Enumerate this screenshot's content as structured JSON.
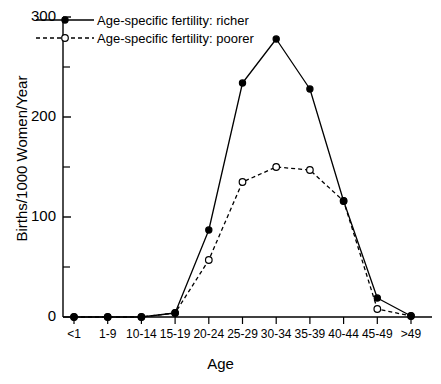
{
  "chart_data": {
    "type": "line",
    "title": "",
    "xlabel": "Age",
    "ylabel": "Births/1000 Women/Year",
    "categories": [
      "<1",
      "1-9",
      "10-14",
      "15-19",
      "20-24",
      "25-29",
      "30-34",
      "35-39",
      "40-44",
      "45-49",
      ">49"
    ],
    "ylim": [
      0,
      300
    ],
    "yticks": [
      0,
      100,
      200,
      300
    ],
    "ytick_labels": [
      "0",
      "100",
      "200",
      "300"
    ],
    "yminor_ticks": [
      50,
      150,
      250
    ],
    "grid": false,
    "legend_position": "top-left",
    "series": [
      {
        "name": "Age-specific fertility: richer",
        "marker": "filled-circle",
        "line_style": "solid",
        "color": "#000000",
        "values": [
          0,
          0,
          0,
          4,
          87,
          234,
          278,
          228,
          116,
          19,
          1
        ]
      },
      {
        "name": "Age-specific fertility: poorer",
        "marker": "open-circle",
        "line_style": "dashed",
        "color": "#000000",
        "values": [
          0,
          0,
          0,
          4,
          57,
          135,
          150,
          147,
          116,
          8,
          1
        ]
      }
    ]
  },
  "legend": {
    "items": [
      {
        "label": "Age-specific fertility: richer"
      },
      {
        "label": "Age-specific fertility: poorer"
      }
    ]
  },
  "axes": {
    "x_title": "Age",
    "y_title": "Births/1000 Women/Year"
  }
}
